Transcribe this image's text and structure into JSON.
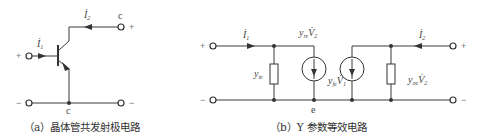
{
  "panel_a": {
    "caption": "（a）晶体管共发射极电路",
    "labels": {
      "i1": "İ",
      "i1_sub": "1",
      "i2": "İ",
      "i2_sub": "2",
      "top_node": "c",
      "bottom_node": "c",
      "plus_left": "+",
      "minus_left": "−",
      "plus_right": "+",
      "minus_right": "−"
    }
  },
  "panel_b": {
    "caption": "（b）Y 参数等效电路",
    "labels": {
      "i1": "İ",
      "i1_sub": "1",
      "i2": "İ",
      "i2_sub": "2",
      "yie": "y",
      "yie_sub": "ie",
      "yre": "y",
      "yre_sub": "re",
      "yre_v": "V̇",
      "yre_v_sub": "2",
      "yfe": "y",
      "yfe_sub": "fe",
      "yfe_v": "V̇",
      "yfe_v_sub": "1",
      "yoe": "y",
      "yoe_sub": "oe",
      "yoe_v": "V̇",
      "yoe_v_sub": "2",
      "bottom_node": "e",
      "plus_left": "+",
      "minus_left": "−",
      "plus_right": "+",
      "minus_right": "−"
    }
  }
}
